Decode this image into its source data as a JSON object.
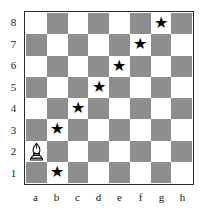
{
  "diagram": {
    "type": "chessboard",
    "orientation": "white-bottom",
    "files": [
      "a",
      "b",
      "c",
      "d",
      "e",
      "f",
      "g",
      "h"
    ],
    "ranks": [
      "8",
      "7",
      "6",
      "5",
      "4",
      "3",
      "2",
      "1"
    ],
    "colors": {
      "light_square": "#ffffff",
      "dark_square_hatch": "#8d8d8d",
      "border": "#2b2b2b",
      "label": "#1a1a1a",
      "star": "#000000",
      "piece_outline": "#000000",
      "piece_fill": "#ffffff",
      "background": "#ffffff"
    },
    "squares": [
      {
        "id": "a8",
        "file": "a",
        "rank": "8",
        "shade": "light",
        "content": ""
      },
      {
        "id": "b8",
        "file": "b",
        "rank": "8",
        "shade": "dark",
        "content": ""
      },
      {
        "id": "c8",
        "file": "c",
        "rank": "8",
        "shade": "light",
        "content": ""
      },
      {
        "id": "d8",
        "file": "d",
        "rank": "8",
        "shade": "dark",
        "content": ""
      },
      {
        "id": "e8",
        "file": "e",
        "rank": "8",
        "shade": "light",
        "content": ""
      },
      {
        "id": "f8",
        "file": "f",
        "rank": "8",
        "shade": "dark",
        "content": ""
      },
      {
        "id": "g8",
        "file": "g",
        "rank": "8",
        "shade": "light",
        "content": "star"
      },
      {
        "id": "h8",
        "file": "h",
        "rank": "8",
        "shade": "dark",
        "content": ""
      },
      {
        "id": "a7",
        "file": "a",
        "rank": "7",
        "shade": "dark",
        "content": ""
      },
      {
        "id": "b7",
        "file": "b",
        "rank": "7",
        "shade": "light",
        "content": ""
      },
      {
        "id": "c7",
        "file": "c",
        "rank": "7",
        "shade": "dark",
        "content": ""
      },
      {
        "id": "d7",
        "file": "d",
        "rank": "7",
        "shade": "light",
        "content": ""
      },
      {
        "id": "e7",
        "file": "e",
        "rank": "7",
        "shade": "dark",
        "content": ""
      },
      {
        "id": "f7",
        "file": "f",
        "rank": "7",
        "shade": "light",
        "content": "star"
      },
      {
        "id": "g7",
        "file": "g",
        "rank": "7",
        "shade": "dark",
        "content": ""
      },
      {
        "id": "h7",
        "file": "h",
        "rank": "7",
        "shade": "light",
        "content": ""
      },
      {
        "id": "a6",
        "file": "a",
        "rank": "6",
        "shade": "light",
        "content": ""
      },
      {
        "id": "b6",
        "file": "b",
        "rank": "6",
        "shade": "dark",
        "content": ""
      },
      {
        "id": "c6",
        "file": "c",
        "rank": "6",
        "shade": "light",
        "content": ""
      },
      {
        "id": "d6",
        "file": "d",
        "rank": "6",
        "shade": "dark",
        "content": ""
      },
      {
        "id": "e6",
        "file": "e",
        "rank": "6",
        "shade": "light",
        "content": "star"
      },
      {
        "id": "f6",
        "file": "f",
        "rank": "6",
        "shade": "dark",
        "content": ""
      },
      {
        "id": "g6",
        "file": "g",
        "rank": "6",
        "shade": "light",
        "content": ""
      },
      {
        "id": "h6",
        "file": "h",
        "rank": "6",
        "shade": "dark",
        "content": ""
      },
      {
        "id": "a5",
        "file": "a",
        "rank": "5",
        "shade": "dark",
        "content": ""
      },
      {
        "id": "b5",
        "file": "b",
        "rank": "5",
        "shade": "light",
        "content": ""
      },
      {
        "id": "c5",
        "file": "c",
        "rank": "5",
        "shade": "dark",
        "content": ""
      },
      {
        "id": "d5",
        "file": "d",
        "rank": "5",
        "shade": "light",
        "content": "star"
      },
      {
        "id": "e5",
        "file": "e",
        "rank": "5",
        "shade": "dark",
        "content": ""
      },
      {
        "id": "f5",
        "file": "f",
        "rank": "5",
        "shade": "light",
        "content": ""
      },
      {
        "id": "g5",
        "file": "g",
        "rank": "5",
        "shade": "dark",
        "content": ""
      },
      {
        "id": "h5",
        "file": "h",
        "rank": "5",
        "shade": "light",
        "content": ""
      },
      {
        "id": "a4",
        "file": "a",
        "rank": "4",
        "shade": "light",
        "content": ""
      },
      {
        "id": "b4",
        "file": "b",
        "rank": "4",
        "shade": "dark",
        "content": ""
      },
      {
        "id": "c4",
        "file": "c",
        "rank": "4",
        "shade": "light",
        "content": "star"
      },
      {
        "id": "d4",
        "file": "d",
        "rank": "4",
        "shade": "dark",
        "content": ""
      },
      {
        "id": "e4",
        "file": "e",
        "rank": "4",
        "shade": "light",
        "content": ""
      },
      {
        "id": "f4",
        "file": "f",
        "rank": "4",
        "shade": "dark",
        "content": ""
      },
      {
        "id": "g4",
        "file": "g",
        "rank": "4",
        "shade": "light",
        "content": ""
      },
      {
        "id": "h4",
        "file": "h",
        "rank": "4",
        "shade": "dark",
        "content": ""
      },
      {
        "id": "a3",
        "file": "a",
        "rank": "3",
        "shade": "dark",
        "content": ""
      },
      {
        "id": "b3",
        "file": "b",
        "rank": "3",
        "shade": "light",
        "content": "star"
      },
      {
        "id": "c3",
        "file": "c",
        "rank": "3",
        "shade": "dark",
        "content": ""
      },
      {
        "id": "d3",
        "file": "d",
        "rank": "3",
        "shade": "light",
        "content": ""
      },
      {
        "id": "e3",
        "file": "e",
        "rank": "3",
        "shade": "dark",
        "content": ""
      },
      {
        "id": "f3",
        "file": "f",
        "rank": "3",
        "shade": "light",
        "content": ""
      },
      {
        "id": "g3",
        "file": "g",
        "rank": "3",
        "shade": "dark",
        "content": ""
      },
      {
        "id": "h3",
        "file": "h",
        "rank": "3",
        "shade": "light",
        "content": ""
      },
      {
        "id": "a2",
        "file": "a",
        "rank": "2",
        "shade": "light",
        "content": "white-bishop"
      },
      {
        "id": "b2",
        "file": "b",
        "rank": "2",
        "shade": "dark",
        "content": ""
      },
      {
        "id": "c2",
        "file": "c",
        "rank": "2",
        "shade": "light",
        "content": ""
      },
      {
        "id": "d2",
        "file": "d",
        "rank": "2",
        "shade": "dark",
        "content": ""
      },
      {
        "id": "e2",
        "file": "e",
        "rank": "2",
        "shade": "light",
        "content": ""
      },
      {
        "id": "f2",
        "file": "f",
        "rank": "2",
        "shade": "dark",
        "content": ""
      },
      {
        "id": "g2",
        "file": "g",
        "rank": "2",
        "shade": "light",
        "content": ""
      },
      {
        "id": "h2",
        "file": "h",
        "rank": "2",
        "shade": "dark",
        "content": ""
      },
      {
        "id": "a1",
        "file": "a",
        "rank": "1",
        "shade": "dark",
        "content": ""
      },
      {
        "id": "b1",
        "file": "b",
        "rank": "1",
        "shade": "light",
        "content": "star"
      },
      {
        "id": "c1",
        "file": "c",
        "rank": "1",
        "shade": "dark",
        "content": ""
      },
      {
        "id": "d1",
        "file": "d",
        "rank": "1",
        "shade": "light",
        "content": ""
      },
      {
        "id": "e1",
        "file": "e",
        "rank": "1",
        "shade": "dark",
        "content": ""
      },
      {
        "id": "f1",
        "file": "f",
        "rank": "1",
        "shade": "light",
        "content": ""
      },
      {
        "id": "g1",
        "file": "g",
        "rank": "1",
        "shade": "dark",
        "content": ""
      },
      {
        "id": "h1",
        "file": "h",
        "rank": "1",
        "shade": "light",
        "content": ""
      }
    ],
    "pieces": [
      {
        "square": "a2",
        "piece": "bishop",
        "color": "white",
        "glyph": "white-bishop-icon"
      }
    ],
    "stars": [
      "b1",
      "b3",
      "c4",
      "d5",
      "e6",
      "f7",
      "g8"
    ],
    "star_glyph": "★"
  }
}
